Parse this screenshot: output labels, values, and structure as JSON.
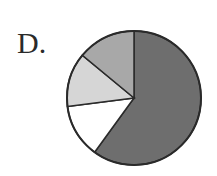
{
  "option_label": "D.",
  "colors": {
    "dark": "#6e6e6e",
    "white": "#ffffff",
    "light": "#d6d6d6",
    "medium": "#a8a8a8",
    "stroke": "#2a2a2a"
  },
  "chart_data": {
    "type": "pie",
    "title": "",
    "start_angle_deg": 0,
    "direction": "clockwise",
    "categories": [
      "dark",
      "white",
      "light",
      "medium"
    ],
    "values": [
      60,
      13,
      13,
      14
    ],
    "legend": "none",
    "data_labels": "none"
  }
}
